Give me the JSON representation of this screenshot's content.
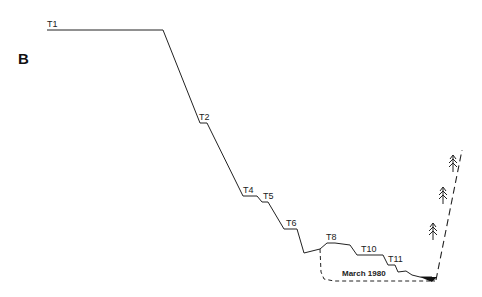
{
  "diagram": {
    "panel_label": "B",
    "terrace_labels": [
      "T1",
      "T2",
      "T4",
      "T5",
      "T6",
      "T8",
      "T10",
      "T11"
    ],
    "annotation": "March 1980",
    "colors": {
      "line": "#222222",
      "background": "#ffffff"
    },
    "elements": {
      "profile": "solid stepped terrace profile descending left to right",
      "dashed_channel": "dashed outline of March 1980 channel",
      "dashed_slope": "dashed right valley wall rising to upper right",
      "trees": 3,
      "water": "black filled wedge at channel bottom"
    }
  }
}
